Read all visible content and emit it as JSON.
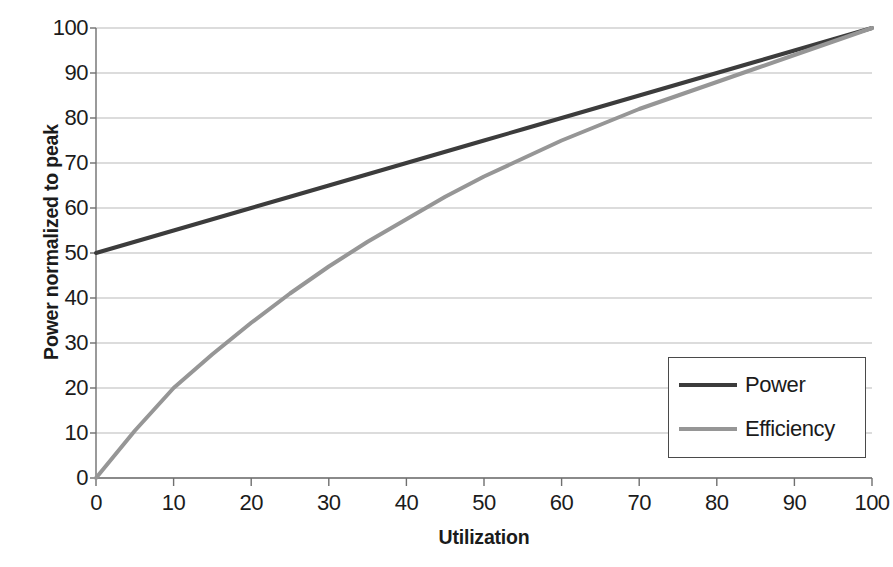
{
  "chart_data": {
    "type": "line",
    "title": "",
    "xlabel": "Utilization",
    "ylabel": "Power normalized to peak",
    "xlim": [
      0,
      100
    ],
    "ylim": [
      0,
      100
    ],
    "xticks": [
      0,
      10,
      20,
      30,
      40,
      50,
      60,
      70,
      80,
      90,
      100
    ],
    "yticks": [
      0,
      10,
      20,
      30,
      40,
      50,
      60,
      70,
      80,
      90,
      100
    ],
    "grid": "horizontal",
    "legend_position": "lower-right-inside",
    "x": [
      0,
      5,
      10,
      15,
      20,
      25,
      30,
      35,
      40,
      45,
      50,
      55,
      60,
      65,
      70,
      75,
      80,
      85,
      90,
      95,
      100
    ],
    "series": [
      {
        "name": "Power",
        "color": "#3c3c3c",
        "width": 4,
        "values": [
          50,
          52.5,
          55,
          57.5,
          60,
          62.5,
          65,
          67.5,
          70,
          72.5,
          75,
          77.5,
          80,
          82.5,
          85,
          87.5,
          90,
          92.5,
          95,
          97.5,
          100
        ]
      },
      {
        "name": "Efficiency",
        "color": "#969696",
        "width": 4,
        "values": [
          0,
          10.5,
          20,
          27.5,
          34.5,
          41,
          47,
          52.5,
          57.5,
          62.5,
          67,
          71,
          75,
          78.5,
          82,
          85,
          88,
          91,
          94,
          97,
          100
        ]
      }
    ]
  },
  "axes": {
    "y_tick_labels": [
      "100",
      "90",
      "80",
      "70",
      "60",
      "50",
      "40",
      "30",
      "20",
      "10",
      "0"
    ],
    "x_tick_labels": [
      "0",
      "10",
      "20",
      "30",
      "40",
      "50",
      "60",
      "70",
      "80",
      "90",
      "100"
    ],
    "x_title": "Utilization",
    "y_title": "Power normalized to peak"
  },
  "legend": {
    "items": [
      {
        "label": "Power",
        "color": "#3c3c3c"
      },
      {
        "label": "Efficiency",
        "color": "#969696"
      }
    ]
  },
  "colors": {
    "power_line": "#3c3c3c",
    "efficiency_line": "#969696",
    "gridline": "#b9b9b9",
    "axis": "#6f6f6f",
    "text": "#1b1b1b",
    "background": "#ffffff",
    "legend_border": "#4a4a4a"
  }
}
